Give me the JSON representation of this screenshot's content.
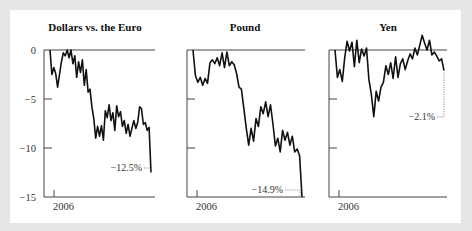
{
  "chart_data": [
    {
      "type": "line",
      "title": "Dollars vs. the Euro",
      "xlabel": "",
      "ylabel": "",
      "x_tick_labels": [
        "2006"
      ],
      "y_ticks": [
        0,
        -5,
        -10,
        -15
      ],
      "ylim": [
        -15,
        0
      ],
      "grid": false,
      "annotation": "−12.5%",
      "final_value": -12.5,
      "series": [
        {
          "name": "Dollars vs. the Euro",
          "values": [
            0,
            -2.5,
            -1.8,
            -2.4,
            -3.8,
            -2.5,
            -1.2,
            -0.3,
            -0.6,
            0,
            -0.8,
            0,
            -1.4,
            -0.6,
            -2.8,
            -1.2,
            -2.3,
            -1.0,
            -3.6,
            -2.0,
            -4.3,
            -4.0,
            -5.8,
            -7.0,
            -9.0,
            -7.8,
            -8.8,
            -7.7,
            -9.2,
            -6.2,
            -6.9,
            -5.6,
            -7.2,
            -6.4,
            -8.2,
            -5.7,
            -6.8,
            -6.3,
            -7.8,
            -7.2,
            -8.5,
            -7.6,
            -8.8,
            -8.0,
            -7.2,
            -8.0,
            -7.4,
            -5.8,
            -6.0,
            -7.6,
            -7.4,
            -8.2,
            -7.9,
            -12.5
          ]
        }
      ]
    },
    {
      "type": "line",
      "title": "Pound",
      "xlabel": "",
      "ylabel": "",
      "x_tick_labels": [
        "2006"
      ],
      "y_ticks": [
        0,
        -5,
        -10,
        -15
      ],
      "ylim": [
        -15,
        0
      ],
      "grid": false,
      "annotation": "−14.9%",
      "final_value": -14.9,
      "series": [
        {
          "name": "Pound",
          "values": [
            0,
            -2.6,
            -3.3,
            -2.8,
            -3.6,
            -2.9,
            -3.4,
            -1.3,
            -1.0,
            -1.4,
            -0.8,
            -1.6,
            -0.3,
            -1.8,
            -0.2,
            -1.6,
            -1.2,
            -1.5,
            -2.4,
            -3.8,
            -4.0,
            -6.0,
            -8.0,
            -9.7,
            -8.0,
            -9.3,
            -7.0,
            -7.8,
            -5.8,
            -6.5,
            -5.3,
            -6.8,
            -5.6,
            -7.5,
            -9.8,
            -9.0,
            -10.4,
            -8.2,
            -9.2,
            -8.4,
            -9.7,
            -8.8,
            -10.4,
            -10.1,
            -10.8,
            -15.0
          ]
        }
      ]
    },
    {
      "type": "line",
      "title": "Yen",
      "xlabel": "",
      "ylabel": "",
      "x_tick_labels": [
        "2006"
      ],
      "y_ticks": [
        0,
        -5,
        -10,
        -15
      ],
      "ylim": [
        -15,
        1.5
      ],
      "grid": false,
      "annotation": "−2.1%",
      "final_value": -2.1,
      "series": [
        {
          "name": "Yen",
          "values": [
            0,
            -2.8,
            -2.0,
            -3.2,
            -0.8,
            0.9,
            -0.1,
            0.8,
            -1.7,
            1.0,
            -1.3,
            0.1,
            -0.6,
            0.2,
            -3.0,
            -4.5,
            -6.8,
            -4.2,
            -5.2,
            -3.8,
            -3.3,
            -1.6,
            -2.5,
            -1.3,
            -2.9,
            -0.7,
            -2.8,
            -1.4,
            -0.9,
            -2.0,
            -1.1,
            -0.4,
            -0.9,
            0.2,
            -0.5,
            0.5,
            1.5,
            0.7,
            0.0,
            1.0,
            -0.5,
            -0.2,
            -0.6,
            -1.1,
            -0.9,
            -2.1
          ]
        }
      ]
    }
  ],
  "panels": [
    {
      "title": "Dollars vs. the Euro",
      "y_tick_labels": [
        "0",
        "−5",
        "−10",
        "−15"
      ],
      "x_tick_label": "2006",
      "annotation": "−12.5%"
    },
    {
      "title": "Pound",
      "y_tick_labels": [],
      "x_tick_label": "2006",
      "annotation": "−14.9%"
    },
    {
      "title": "Yen",
      "y_tick_labels": [],
      "x_tick_label": "2006",
      "annotation": "−2.1%"
    }
  ]
}
